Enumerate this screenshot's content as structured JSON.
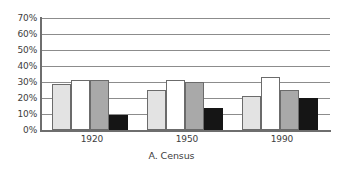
{
  "chart_data": {
    "type": "bar",
    "title": "A. Census",
    "xlabel": "",
    "ylabel": "",
    "categories": [
      "1920",
      "1950",
      "1990"
    ],
    "series": [
      {
        "name": "series-1",
        "color": "#e3e3e3",
        "values": [
          29,
          25,
          21
        ]
      },
      {
        "name": "series-2",
        "color": "#ffffff",
        "values": [
          31,
          31,
          33
        ]
      },
      {
        "name": "series-3",
        "color": "#a9a9a9",
        "values": [
          31.5,
          30,
          25
        ]
      },
      {
        "name": "series-4",
        "color": "#151515",
        "values": [
          9.5,
          13.5,
          20
        ]
      }
    ],
    "ylim": [
      0,
      70
    ],
    "ytick_labels": [
      "0%",
      "10%",
      "20%",
      "30%",
      "40%",
      "50%",
      "60%",
      "70%"
    ],
    "ytick_values": [
      0,
      10,
      20,
      30,
      40,
      50,
      60,
      70
    ],
    "grid": true,
    "legend": "none",
    "annotations": []
  },
  "axis": {
    "gridline_color": "#8c8c8c",
    "axis_color": "#6e6e6e",
    "bar_outline_color": "#6b6b6b",
    "text_color": "#3d3d3d",
    "background": "#ffffff"
  }
}
